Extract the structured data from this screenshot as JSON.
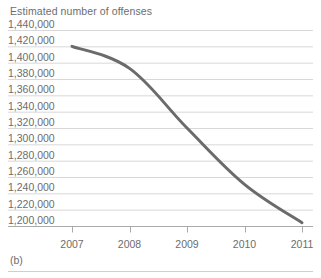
{
  "figure": {
    "caption": "(b)",
    "title": "Estimated number of offenses"
  },
  "colors": {
    "line": "#6b6b6b",
    "grid": "#d8d8d8",
    "axis": "#aaaaaa",
    "text": "#6d6d6d",
    "background": "#ffffff"
  },
  "axis": {
    "y_labels": [
      "1,440,000",
      "1,420,000",
      "1,400,000",
      "1,380,000",
      "1,360,000",
      "1,340,000",
      "1,320,000",
      "1,300,000",
      "1,280,000",
      "1,260,000",
      "1,240,000",
      "1,220,000",
      "1,200,000"
    ],
    "x_labels": [
      "2007",
      "2008",
      "2009",
      "2010",
      "2011"
    ]
  },
  "chart_data": {
    "type": "line",
    "title": "Estimated number of offenses",
    "xlabel": "",
    "ylabel": "Estimated number of offenses",
    "categories": [
      "2007",
      "2008",
      "2009",
      "2010",
      "2011"
    ],
    "x": [
      2007,
      2008,
      2009,
      2010,
      2011
    ],
    "values": [
      1420000,
      1393000,
      1320000,
      1251000,
      1204000
    ],
    "series": [
      {
        "name": "Estimated number of offenses",
        "values": [
          1420000,
          1393000,
          1320000,
          1251000,
          1204000
        ]
      }
    ],
    "ylim": [
      1200000,
      1440000
    ],
    "ytick_step": 20000,
    "xlim": [
      2007,
      2011
    ],
    "grid": true,
    "grid_axis": "y",
    "legend": false,
    "line_color": "#6b6b6b",
    "line_width": 3,
    "markers": false
  }
}
